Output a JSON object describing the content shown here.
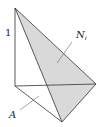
{
  "diagram": {
    "type": "tetrahedron",
    "labels": {
      "height": "1",
      "face": "N",
      "face_sub": "i",
      "base": "A"
    },
    "colors": {
      "stroke": "#333333",
      "shaded_face": "#d9d9d9",
      "background": "#ffffff"
    }
  }
}
